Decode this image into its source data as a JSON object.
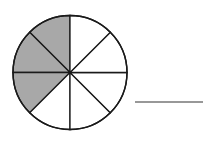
{
  "diagram": {
    "total_parts": 8,
    "shaded_parts": 3,
    "shaded_color": "#a8a8a8",
    "unshaded_color": "#ffffff",
    "line_color": "#1a1a1a",
    "answer_blank": ""
  }
}
